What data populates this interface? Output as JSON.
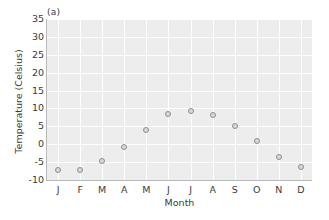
{
  "chart_data": {
    "type": "scatter",
    "title": "(a)",
    "xlabel": "Month",
    "ylabel": "Temperature (Celsius)",
    "categories": [
      "J",
      "F",
      "M",
      "A",
      "M",
      "J",
      "J",
      "A",
      "S",
      "O",
      "N",
      "D"
    ],
    "values": [
      -7.3,
      -7.3,
      -4.6,
      -0.8,
      4.0,
      8.5,
      9.3,
      8.3,
      5.0,
      0.8,
      -3.6,
      -6.3
    ],
    "ylim": [
      -10,
      35
    ],
    "ytick_labels": [
      "35",
      "30",
      "25",
      "20",
      "15",
      "10",
      "5",
      "0",
      "-5",
      "-10"
    ],
    "ytick_values": [
      35,
      30,
      25,
      20,
      15,
      10,
      5,
      0,
      -5,
      -10
    ],
    "grid": true,
    "legend": "none",
    "marker_color": "#8e8e8e",
    "marker_fill": "#d8d8d8",
    "plot_background": "#ededed",
    "gridline_color": "#ffffff",
    "text_color": "#3b3b3b"
  },
  "panel": {
    "label": "(a)"
  },
  "axes": {
    "x_title": "Month",
    "y_title": "Temperature (Celsius)"
  }
}
